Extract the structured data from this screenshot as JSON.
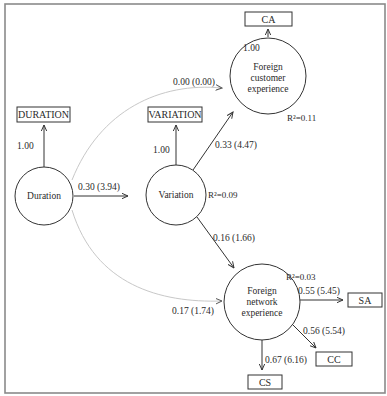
{
  "diagram": {
    "type": "path-model",
    "latent_nodes": [
      {
        "id": "duration",
        "label": "Duration"
      },
      {
        "id": "variation",
        "label": "Variation",
        "r2": "R²=0.09"
      },
      {
        "id": "fce",
        "label_lines": [
          "Foreign",
          "customer",
          "experience"
        ],
        "r2": "R²=0.11"
      },
      {
        "id": "fne",
        "label_lines": [
          "Foreign",
          "network",
          "experience"
        ],
        "r2": "R²=0.03"
      }
    ],
    "indicators": [
      {
        "id": "DURATION",
        "label": "DURATION",
        "loading": "1.00"
      },
      {
        "id": "VARIATION",
        "label": "VARIATION",
        "loading": "1.00"
      },
      {
        "id": "CA",
        "label": "CA",
        "loading": "1.00"
      },
      {
        "id": "SA",
        "label": "SA",
        "loading": "0.55 (5.45)"
      },
      {
        "id": "CC",
        "label": "CC",
        "loading": "0.56 (5.54)"
      },
      {
        "id": "CS",
        "label": "CS",
        "loading": "0.67 (6.16)"
      }
    ],
    "paths": [
      {
        "from": "Duration",
        "to": "Variation",
        "label": "0.30 (3.94)"
      },
      {
        "from": "Duration",
        "to": "Foreign customer experience",
        "label": "0.00 (0.00)"
      },
      {
        "from": "Duration",
        "to": "Foreign network experience",
        "label": "0.17 (1.74)"
      },
      {
        "from": "Variation",
        "to": "Foreign customer experience",
        "label": "0.33 (4.47)"
      },
      {
        "from": "Variation",
        "to": "Foreign network experience",
        "label": "0.16 (1.66)"
      }
    ]
  }
}
